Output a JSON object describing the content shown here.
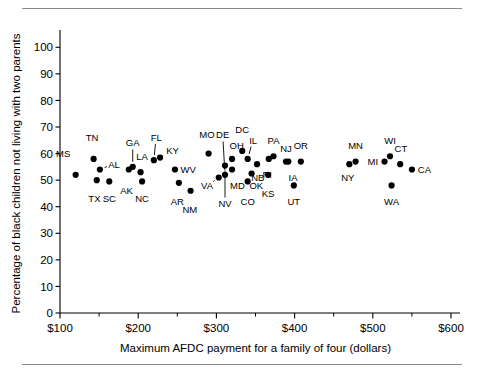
{
  "figure": {
    "has_top_rule": true,
    "has_bottom_rule": true
  },
  "chart_data": {
    "type": "scatter",
    "title": "",
    "xlabel": "Maximum AFDC payment for a family of four (dollars)",
    "ylabel": "Percentage of black children not living with two parents",
    "xlim": [
      100,
      600
    ],
    "ylim": [
      0,
      105
    ],
    "xticks": [
      100,
      200,
      300,
      400,
      500,
      600
    ],
    "xticklabels": [
      "$100",
      "$200",
      "$300",
      "$400",
      "$500",
      "$600"
    ],
    "xminorticks": [
      150,
      250,
      350,
      450,
      550
    ],
    "yticks": [
      0,
      10,
      20,
      30,
      40,
      50,
      60,
      70,
      80,
      90,
      100
    ],
    "yticklabels": [
      "0",
      "10",
      "20",
      "30",
      "40",
      "50",
      "60",
      "70",
      "80",
      "90",
      "100"
    ],
    "grid": false,
    "legend": "none",
    "marker": "filled-circle",
    "marker_color": "#000000",
    "points": [
      {
        "label": "MS",
        "x": 120,
        "y": 52,
        "lx": 104,
        "ly": 60,
        "leader": false
      },
      {
        "label": "TN",
        "x": 143,
        "y": 58,
        "lx": 141,
        "ly": 66,
        "leader": false
      },
      {
        "label": "TX",
        "x": 147,
        "y": 50,
        "lx": 144,
        "ly": 43,
        "leader": false
      },
      {
        "label": "AL",
        "x": 151,
        "y": 54,
        "lx": 169,
        "ly": 56,
        "leader": true
      },
      {
        "label": "SC",
        "x": 163,
        "y": 49.5,
        "lx": 163,
        "ly": 43,
        "leader": false
      },
      {
        "label": "AK",
        "x": 188,
        "y": 54,
        "lx": 185,
        "ly": 46,
        "leader": false
      },
      {
        "label": "GA",
        "x": 193,
        "y": 55,
        "lx": 193,
        "ly": 64,
        "leader": true
      },
      {
        "label": "LA",
        "x": 203,
        "y": 53,
        "lx": 205,
        "ly": 59,
        "leader": false
      },
      {
        "label": "NC",
        "x": 205,
        "y": 49.5,
        "lx": 205,
        "ly": 43,
        "leader": false
      },
      {
        "label": "FL",
        "x": 220,
        "y": 57.5,
        "lx": 223,
        "ly": 66,
        "leader": true
      },
      {
        "label": "KY",
        "x": 228,
        "y": 58.5,
        "lx": 244,
        "ly": 61,
        "leader": false
      },
      {
        "label": "WV",
        "x": 247,
        "y": 54,
        "lx": 264,
        "ly": 54,
        "leader": false
      },
      {
        "label": "AR",
        "x": 252,
        "y": 49,
        "lx": 250,
        "ly": 42,
        "leader": false
      },
      {
        "label": "NM",
        "x": 267,
        "y": 46,
        "lx": 266,
        "ly": 39,
        "leader": false
      },
      {
        "label": "MO",
        "x": 290,
        "y": 60,
        "lx": 288,
        "ly": 67,
        "leader": false
      },
      {
        "label": "VA",
        "x": 303,
        "y": 51,
        "lx": 288,
        "ly": 48,
        "leader": true
      },
      {
        "label": "DE",
        "x": 311,
        "y": 52,
        "lx": 308,
        "ly": 67,
        "leader": true
      },
      {
        "label": "NV",
        "x": 311,
        "y": 55.5,
        "lx": 311,
        "ly": 41,
        "leader": true
      },
      {
        "label": "OH",
        "x": 320,
        "y": 58,
        "lx": 326,
        "ly": 63,
        "leader": false
      },
      {
        "label": "MD",
        "x": 320,
        "y": 54,
        "lx": 327,
        "ly": 48,
        "leader": false
      },
      {
        "label": "DC",
        "x": 333,
        "y": 61,
        "lx": 333,
        "ly": 69,
        "leader": false
      },
      {
        "label": "IL",
        "x": 340,
        "y": 58,
        "lx": 347,
        "ly": 65,
        "leader": true
      },
      {
        "label": "CO",
        "x": 340,
        "y": 49.5,
        "lx": 340,
        "ly": 42,
        "leader": false
      },
      {
        "label": "OK",
        "x": 345,
        "y": 52.5,
        "lx": 351,
        "ly": 48,
        "leader": false
      },
      {
        "label": "NB",
        "x": 352,
        "y": 56,
        "lx": 353,
        "ly": 51,
        "leader": false
      },
      {
        "label": "RI",
        "x": 367,
        "y": 58,
        "lx": 365,
        "ly": 52,
        "leader": false
      },
      {
        "label": "PA",
        "x": 373,
        "y": 59,
        "lx": 373,
        "ly": 65,
        "leader": false
      },
      {
        "label": "KS",
        "x": 366,
        "y": 52,
        "lx": 366,
        "ly": 45,
        "leader": false
      },
      {
        "label": "NJ",
        "x": 389,
        "y": 57,
        "lx": 389,
        "ly": 62,
        "leader": false
      },
      {
        "label": "IA",
        "x": 392,
        "y": 57,
        "lx": 398,
        "ly": 51,
        "leader": false
      },
      {
        "label": "UT",
        "x": 399,
        "y": 48,
        "lx": 399,
        "ly": 42,
        "leader": false
      },
      {
        "label": "OR",
        "x": 408,
        "y": 57,
        "lx": 408,
        "ly": 63,
        "leader": false
      },
      {
        "label": "NY",
        "x": 470,
        "y": 56,
        "lx": 468,
        "ly": 51,
        "leader": false
      },
      {
        "label": "MN",
        "x": 478,
        "y": 57,
        "lx": 478,
        "ly": 63,
        "leader": false
      },
      {
        "label": "MI",
        "x": 515,
        "y": 57,
        "lx": 500,
        "ly": 57,
        "leader": false
      },
      {
        "label": "WI",
        "x": 522,
        "y": 59,
        "lx": 522,
        "ly": 65,
        "leader": false
      },
      {
        "label": "CT",
        "x": 535,
        "y": 56,
        "lx": 536,
        "ly": 62,
        "leader": false
      },
      {
        "label": "WA",
        "x": 524,
        "y": 48,
        "lx": 524,
        "ly": 42,
        "leader": false
      },
      {
        "label": "CA",
        "x": 550,
        "y": 54,
        "lx": 566,
        "ly": 54,
        "leader": false
      }
    ]
  }
}
